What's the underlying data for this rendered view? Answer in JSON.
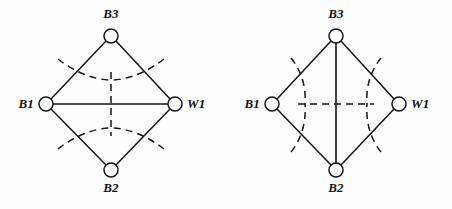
{
  "figure": {
    "caption": "",
    "background_color": "#fdfdfd",
    "stroke_color": "#141414",
    "width": 452,
    "height": 209
  },
  "diagrams": [
    {
      "id": "left-diagram",
      "name": "horizontal-diagonal-rhombus",
      "nodes": [
        {
          "id": "B3",
          "label": "B3",
          "cx": 111,
          "cy": 36,
          "r": 7,
          "label_x": 111,
          "label_y": 18,
          "label_anchor": "middle"
        },
        {
          "id": "B1",
          "label": "B1",
          "cx": 46,
          "cy": 104,
          "r": 7,
          "label_x": 34,
          "label_y": 108,
          "label_anchor": "end"
        },
        {
          "id": "W1",
          "label": "W1",
          "cx": 175,
          "cy": 104,
          "r": 7,
          "label_x": 187,
          "label_y": 108,
          "label_anchor": "start"
        },
        {
          "id": "B2",
          "label": "B2",
          "cx": 111,
          "cy": 170,
          "r": 7,
          "label_x": 111,
          "label_y": 192,
          "label_anchor": "middle"
        }
      ],
      "solid_edges": [
        {
          "from": "B3",
          "to": "B1"
        },
        {
          "from": "B3",
          "to": "W1"
        },
        {
          "from": "B1",
          "to": "B2"
        },
        {
          "from": "W1",
          "to": "B2"
        }
      ],
      "solid_diagonal": {
        "from": "B1",
        "to": "W1",
        "orientation": "horizontal"
      },
      "dashed_paths": [
        "M 58 59 C 74 72, 95 80, 111 80",
        "M 164 59 C 148 72, 127 80, 111 80",
        "M 58 149 C 74 136, 95 128, 111 128",
        "M 164 149 C 148 136, 127 128, 111 128",
        "M 111 72 L 111 136"
      ]
    },
    {
      "id": "right-diagram",
      "name": "vertical-diagonal-rhombus",
      "nodes": [
        {
          "id": "B3",
          "label": "B3",
          "cx": 336,
          "cy": 36,
          "r": 7,
          "label_x": 336,
          "label_y": 18,
          "label_anchor": "middle"
        },
        {
          "id": "B1",
          "label": "B1",
          "cx": 272,
          "cy": 104,
          "r": 7,
          "label_x": 260,
          "label_y": 108,
          "label_anchor": "end"
        },
        {
          "id": "W1",
          "label": "W1",
          "cx": 399,
          "cy": 104,
          "r": 7,
          "label_x": 411,
          "label_y": 108,
          "label_anchor": "start"
        },
        {
          "id": "B2",
          "label": "B2",
          "cx": 336,
          "cy": 170,
          "r": 7,
          "label_x": 336,
          "label_y": 192,
          "label_anchor": "middle"
        }
      ],
      "solid_edges": [
        {
          "from": "B3",
          "to": "B1"
        },
        {
          "from": "B3",
          "to": "W1"
        },
        {
          "from": "B1",
          "to": "B2"
        },
        {
          "from": "W1",
          "to": "B2"
        }
      ],
      "solid_diagonal": {
        "from": "B3",
        "to": "B2",
        "orientation": "vertical"
      },
      "dashed_paths": [
        "M 291 58 C 304 74, 306 92, 305 104",
        "M 291 152 C 304 136, 306 117, 305 104",
        "M 381 58 C 368 74, 366 92, 367 104",
        "M 381 152 C 368 136, 366 117, 367 104",
        "M 298 104 L 374 104"
      ]
    }
  ]
}
